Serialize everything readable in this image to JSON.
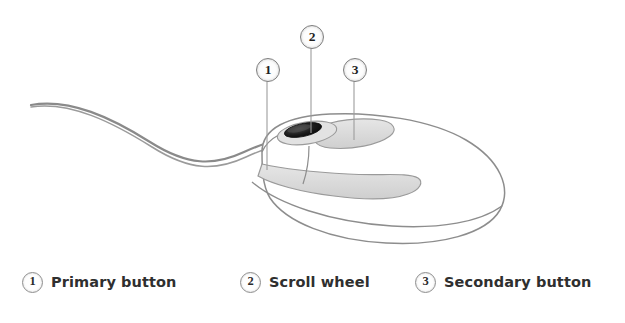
{
  "figure": {
    "background_color": "#ffffff",
    "ink_color": "#6b6b6b",
    "shade_color": "#d8d8d8",
    "wheel_color": "#1d1d1d"
  },
  "callouts": [
    {
      "id": "1",
      "number": "1",
      "cx": 267,
      "cy": 69,
      "line_to_y": 170,
      "target": "primary-button"
    },
    {
      "id": "2",
      "number": "2",
      "cx": 311,
      "cy": 36,
      "line_to_y": 133,
      "target": "scroll-wheel"
    },
    {
      "id": "3",
      "number": "3",
      "cx": 354,
      "cy": 69,
      "line_to_y": 140,
      "target": "secondary-button"
    }
  ],
  "legend": {
    "items": [
      {
        "number": "1",
        "label": "Primary button"
      },
      {
        "number": "2",
        "label": "Scroll wheel"
      },
      {
        "number": "3",
        "label": "Secondary button"
      }
    ]
  }
}
